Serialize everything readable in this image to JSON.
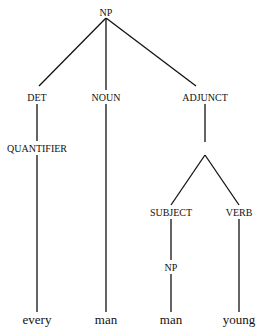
{
  "diagram": {
    "type": "syntax-tree",
    "nodes": {
      "root": {
        "label": "NP",
        "x": 106,
        "y": 12
      },
      "det": {
        "label": "DET",
        "x": 37,
        "y": 97
      },
      "noun": {
        "label": "NOUN",
        "x": 106,
        "y": 97
      },
      "adjunct": {
        "label": "ADJUNCT",
        "x": 205,
        "y": 97
      },
      "quantifier": {
        "label": "QUANTIFIER",
        "x": 37,
        "y": 148
      },
      "subject": {
        "label": "SUBJECT",
        "x": 171,
        "y": 212
      },
      "verb": {
        "label": "VERB",
        "x": 239,
        "y": 212
      },
      "sub_np": {
        "label": "NP",
        "x": 171,
        "y": 267
      },
      "word_every": {
        "label": "every",
        "x": 37,
        "y": 320
      },
      "word_man1": {
        "label": "man",
        "x": 106,
        "y": 320
      },
      "word_man2": {
        "label": "man",
        "x": 171,
        "y": 320
      },
      "word_young": {
        "label": "young",
        "x": 239,
        "y": 320
      }
    },
    "edges": [
      [
        "root",
        "det"
      ],
      [
        "root",
        "noun"
      ],
      [
        "root",
        "adjunct"
      ],
      [
        "det",
        "quantifier"
      ],
      [
        "quantifier",
        "word_every"
      ],
      [
        "noun",
        "word_man1"
      ],
      [
        "adjunct",
        "branch"
      ],
      [
        "branch",
        "subject"
      ],
      [
        "branch",
        "verb"
      ],
      [
        "subject",
        "sub_np"
      ],
      [
        "sub_np",
        "word_man2"
      ],
      [
        "verb",
        "word_young"
      ]
    ],
    "line_color": "#111111"
  }
}
